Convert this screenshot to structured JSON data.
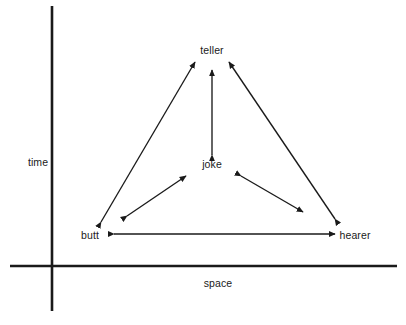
{
  "figure": {
    "type": "diagram",
    "background_color": "#ffffff",
    "stroke_color": "#1a1a1a",
    "text_color": "#1a1a1a"
  },
  "axes": {
    "y_axis": {
      "label": "time",
      "label_x": 38,
      "label_y": 162,
      "x": 52,
      "y_top": 6,
      "y_bottom": 311
    },
    "x_axis": {
      "label": "space",
      "label_x": 218,
      "label_y": 283,
      "y": 266,
      "x_left": 10,
      "x_right": 397
    }
  },
  "nodes": [
    {
      "id": "teller",
      "label": "teller",
      "x": 212,
      "y": 50
    },
    {
      "id": "joke",
      "label": "joke",
      "x": 212,
      "y": 164
    },
    {
      "id": "butt",
      "label": "butt",
      "x": 90,
      "y": 235
    },
    {
      "id": "hearer",
      "label": "hearer",
      "x": 355,
      "y": 235
    }
  ],
  "edges": [
    {
      "id": "teller-butt",
      "from": "butt",
      "to": "teller",
      "arrows": "both",
      "x1": 101,
      "y1": 222,
      "x2": 195,
      "y2": 62
    },
    {
      "id": "teller-hearer",
      "from": "hearer",
      "to": "teller",
      "arrows": "both",
      "x1": 335,
      "y1": 219,
      "x2": 229,
      "y2": 62
    },
    {
      "id": "teller-joke",
      "from": "joke",
      "to": "teller",
      "arrows": "both",
      "x1": 212,
      "y1": 155,
      "x2": 212,
      "y2": 70
    },
    {
      "id": "joke-butt",
      "from": "butt",
      "to": "joke",
      "arrows": "both",
      "x1": 127,
      "y1": 216,
      "x2": 186,
      "y2": 176
    },
    {
      "id": "joke-hearer",
      "from": "joke",
      "to": "hearer",
      "arrows": "both",
      "x1": 241,
      "y1": 176,
      "x2": 303,
      "y2": 212
    },
    {
      "id": "butt-hearer",
      "from": "butt",
      "to": "hearer",
      "arrows": "both",
      "x1": 114,
      "y1": 234,
      "x2": 335,
      "y2": 234
    }
  ]
}
